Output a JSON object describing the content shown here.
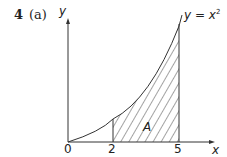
{
  "question": {
    "number": "4",
    "part": "(a)"
  },
  "axes": {
    "x_label": "x",
    "y_label": "y",
    "ticks": [
      {
        "value": "0",
        "px": 66
      },
      {
        "value": "2",
        "px": 110
      },
      {
        "value": "5",
        "px": 176
      }
    ]
  },
  "curve": {
    "label_lhs": "y = ",
    "label_var": "x",
    "label_exp": "2",
    "equation": "y = x^2"
  },
  "region": {
    "label": "A",
    "x_from": 2,
    "x_to": 5,
    "shading": "diagonal-hatch"
  },
  "colors": {
    "line": "#333333",
    "text": "#222222",
    "background": "#ffffff"
  }
}
